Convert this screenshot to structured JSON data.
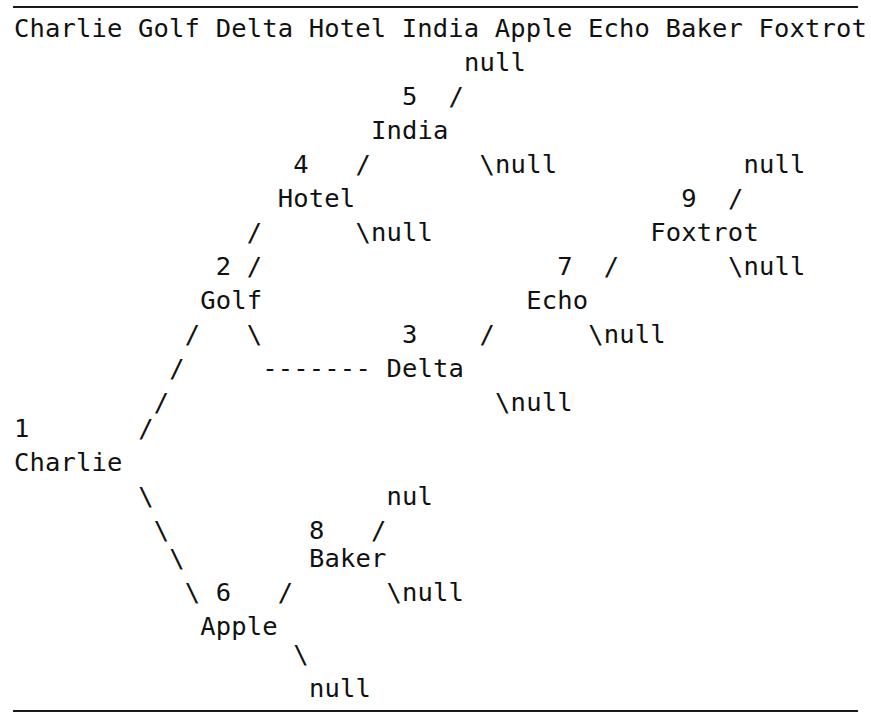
{
  "page": {
    "background_color": "#ffffff",
    "text_color": "#111111",
    "rule_color": "#1a1a1a",
    "width": 871,
    "height": 727
  },
  "rules": {
    "top_label": "horizontal-rule-top",
    "bottom_label": "horizontal-rule-bottom"
  },
  "header": {
    "line": "Charlie Golf Delta Hotel India Apple Echo Baker Foxtrot",
    "node_names": [
      "Charlie",
      "Golf",
      "Delta",
      "Hotel",
      "India",
      "Apple",
      "Echo",
      "Baker",
      "Foxtrot"
    ]
  },
  "tree": {
    "ascii": [
      "                              null",
      "                        5   /",
      "                      India",
      "                 4    /         \\null",
      "                  Hotel",
      "                  /      \\null",
      "            2   /",
      "             Golf",
      "            /     \\          3    /        \\null",
      "           /       ------- Delta",
      "          /                     \\null",
      "  1      /",
      "  Charlie",
      "         \\",
      "          \\              nul",
      "           \\        8   /",
      "            \\        Baker",
      "             \\  6   /      \\null",
      "              Apple",
      "                    \\",
      "                     null"
    ],
    "rows": [
      {
        "id": "row-1",
        "text": "null",
        "col": 29
      },
      {
        "id": "row-2",
        "text": "5   /",
        "col": 25
      },
      {
        "id": "row-3",
        "text": "India",
        "col": 23
      },
      {
        "id": "row-4a",
        "text": "4    /",
        "col": 18
      },
      {
        "id": "row-4b",
        "text": "\\null",
        "col": 30
      },
      {
        "id": "row-5",
        "text": "Hotel",
        "col": 18
      },
      {
        "id": "row-6a",
        "text": "/",
        "col": 18
      },
      {
        "id": "row-6b",
        "text": "\\null",
        "col": 25
      },
      {
        "id": "row-7",
        "text": "2   /",
        "col": 13
      },
      {
        "id": "row-8",
        "text": "Golf",
        "col": 12
      },
      {
        "id": "row-9",
        "text": "/     \\",
        "col": 10
      },
      {
        "id": "row-10",
        "text": "------- Delta",
        "col": 16
      },
      {
        "id": "row-11",
        "text": "1",
        "col": 0
      },
      {
        "id": "row-12",
        "text": "Charlie",
        "col": 0
      },
      {
        "id": "row-13",
        "text": "nul",
        "col": 24
      },
      {
        "id": "row-14",
        "text": "8   /",
        "col": 19
      },
      {
        "id": "row-15",
        "text": "Baker",
        "col": 19
      },
      {
        "id": "row-16",
        "text": "6   /",
        "col": 13
      },
      {
        "id": "row-17",
        "text": "Apple",
        "col": 12
      },
      {
        "id": "row-18",
        "text": "null",
        "col": 18
      }
    ],
    "nodes": [
      {
        "key": 1,
        "name": "Charlie"
      },
      {
        "key": 2,
        "name": "Golf"
      },
      {
        "key": 3,
        "name": "Delta"
      },
      {
        "key": 4,
        "name": "Hotel"
      },
      {
        "key": 5,
        "name": "India"
      },
      {
        "key": 6,
        "name": "Apple"
      },
      {
        "key": 7,
        "name": "Echo"
      },
      {
        "key": 8,
        "name": "Baker"
      },
      {
        "key": 9,
        "name": "Foxtrot"
      }
    ],
    "null_labels": [
      "null",
      "null",
      "null",
      "null",
      "null",
      "null",
      "null",
      "nul",
      "null",
      "null",
      "null"
    ],
    "branch_glyphs": {
      "right": "/",
      "left": "\\",
      "dashes": "-------"
    }
  },
  "lines": [
    {
      "id": "L01",
      "y": 30,
      "segments": [
        {
          "col": 0,
          "text": "Charlie Golf Delta Hotel India Apple Echo Baker Foxtrot"
        }
      ]
    },
    {
      "id": "L02",
      "y": 64,
      "segments": [
        {
          "col": 29,
          "text": "null"
        }
      ]
    },
    {
      "id": "L03",
      "y": 98,
      "segments": [
        {
          "col": 25,
          "text": "5"
        },
        {
          "col": 28,
          "text": "/"
        }
      ]
    },
    {
      "id": "L04",
      "y": 132,
      "segments": [
        {
          "col": 23,
          "text": "India"
        }
      ]
    },
    {
      "id": "L05",
      "y": 166,
      "segments": [
        {
          "col": 18,
          "text": "4"
        },
        {
          "col": 22,
          "text": "/"
        },
        {
          "col": 30,
          "text": "\\null"
        },
        {
          "col": 47,
          "text": "null"
        }
      ]
    },
    {
      "id": "L06",
      "y": 200,
      "segments": [
        {
          "col": 17,
          "text": "Hotel"
        },
        {
          "col": 43,
          "text": "9"
        },
        {
          "col": 46,
          "text": "/"
        }
      ]
    },
    {
      "id": "L07",
      "y": 234,
      "segments": [
        {
          "col": 15,
          "text": "/"
        },
        {
          "col": 22,
          "text": "\\null"
        },
        {
          "col": 41,
          "text": "Foxtrot"
        }
      ]
    },
    {
      "id": "L08",
      "y": 268,
      "segments": [
        {
          "col": 13,
          "text": "2"
        },
        {
          "col": 15,
          "text": "/"
        },
        {
          "col": 35,
          "text": "7"
        },
        {
          "col": 38,
          "text": "/"
        },
        {
          "col": 46,
          "text": "\\null"
        }
      ]
    },
    {
      "id": "L09",
      "y": 302,
      "segments": [
        {
          "col": 12,
          "text": "Golf"
        },
        {
          "col": 33,
          "text": "Echo"
        }
      ]
    },
    {
      "id": "L10",
      "y": 336,
      "segments": [
        {
          "col": 11,
          "text": "/"
        },
        {
          "col": 15,
          "text": "\\"
        },
        {
          "col": 25,
          "text": "3"
        },
        {
          "col": 30,
          "text": "/"
        },
        {
          "col": 37,
          "text": "\\null"
        }
      ]
    },
    {
      "id": "L11",
      "y": 370,
      "segments": [
        {
          "col": 10,
          "text": "/"
        },
        {
          "col": 16,
          "text": "------- Delta"
        }
      ]
    },
    {
      "id": "L12",
      "y": 404,
      "segments": [
        {
          "col": 9,
          "text": "/"
        },
        {
          "col": 31,
          "text": "\\null"
        }
      ]
    },
    {
      "id": "L13",
      "y": 430,
      "segments": [
        {
          "col": 0,
          "text": "1"
        },
        {
          "col": 8,
          "text": "/"
        }
      ]
    },
    {
      "id": "L14",
      "y": 464,
      "segments": [
        {
          "col": 0,
          "text": "Charlie"
        }
      ]
    },
    {
      "id": "L15",
      "y": 498,
      "segments": [
        {
          "col": 8,
          "text": "\\"
        },
        {
          "col": 24,
          "text": "nul"
        }
      ]
    },
    {
      "id": "L16",
      "y": 532,
      "segments": [
        {
          "col": 9,
          "text": "\\"
        },
        {
          "col": 19,
          "text": "8"
        },
        {
          "col": 23,
          "text": "/"
        }
      ]
    },
    {
      "id": "L17",
      "y": 560,
      "segments": [
        {
          "col": 10,
          "text": "\\"
        },
        {
          "col": 19,
          "text": "Baker"
        }
      ]
    },
    {
      "id": "L18",
      "y": 594,
      "segments": [
        {
          "col": 11,
          "text": "\\"
        },
        {
          "col": 13,
          "text": "6"
        },
        {
          "col": 17,
          "text": "/"
        },
        {
          "col": 24,
          "text": "\\null"
        }
      ]
    },
    {
      "id": "L19",
      "y": 628,
      "segments": [
        {
          "col": 12,
          "text": "Apple"
        }
      ]
    },
    {
      "id": "L20",
      "y": 656,
      "segments": [
        {
          "col": 18,
          "text": "\\"
        }
      ]
    },
    {
      "id": "L21",
      "y": 690,
      "segments": [
        {
          "col": 19,
          "text": "null"
        }
      ]
    }
  ],
  "metrics": {
    "char_width_px": 15.52,
    "line_height_px": 34,
    "origin_x_px": 14,
    "font_size_px": 25.5
  }
}
